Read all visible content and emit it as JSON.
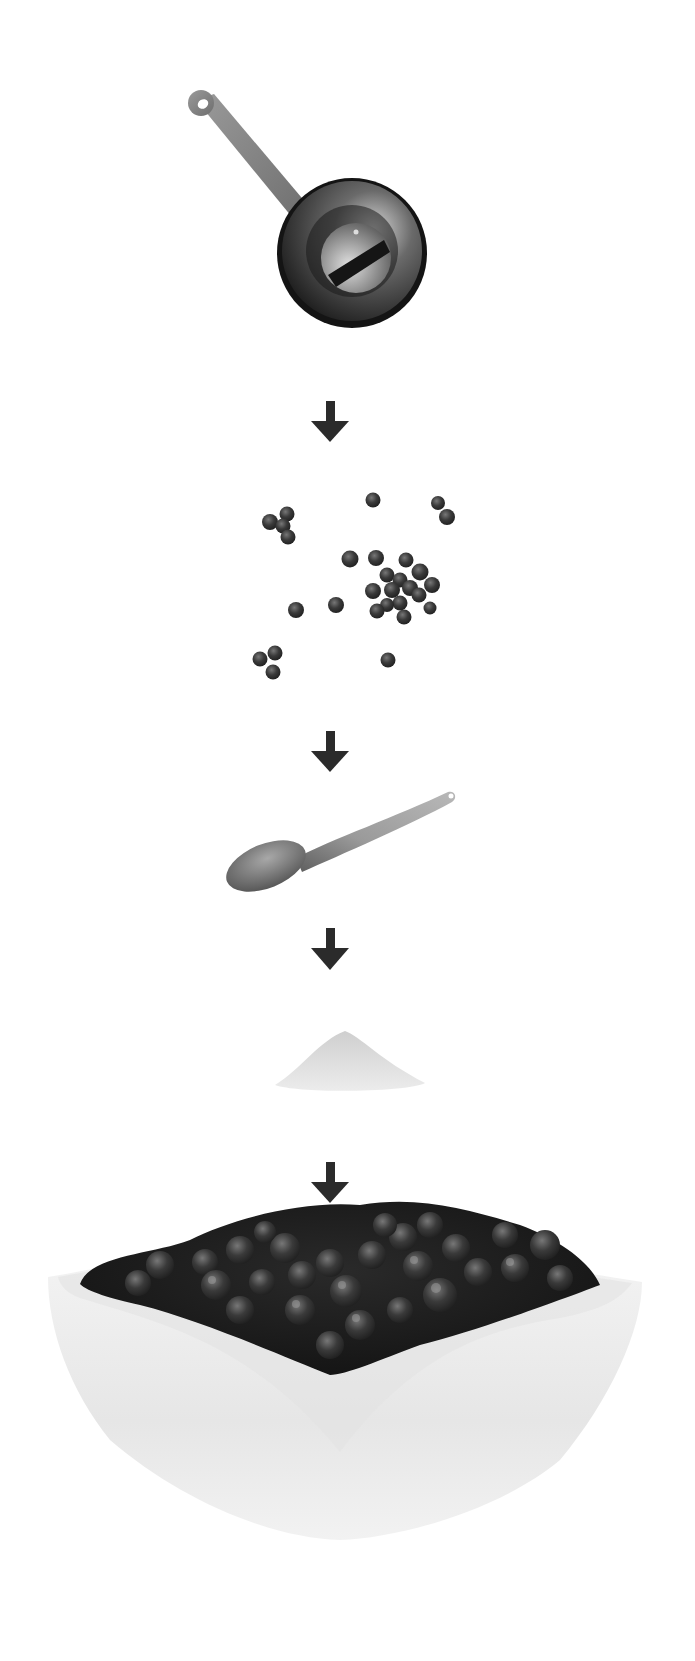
{
  "figure": {
    "type": "recipe-step-illustration",
    "steps": [
      {
        "id": "saucepan",
        "label": "Saucepan",
        "icon": "saucepan-icon"
      },
      {
        "id": "blueberries",
        "label": "Blueberries",
        "icon": "blueberries-icon"
      },
      {
        "id": "wooden-spoon",
        "label": "Spoon",
        "icon": "spoon-icon"
      },
      {
        "id": "sugar",
        "label": "Sugar",
        "icon": "sugar-pile-icon"
      },
      {
        "id": "blueberry-compote",
        "label": "Bowl of blueberry compote",
        "icon": "bowl-icon"
      }
    ],
    "connector": "arrow-down-icon",
    "colors": {
      "background": "#ffffff",
      "arrow": "#2b2b2b",
      "pan_dark": "#1c1c1c",
      "pan_handle": "#8a8a8a",
      "berry": "#3a3a3a",
      "spoon": "#8c8c8c",
      "sugar": "#dcdcdc",
      "bowl": "#efefef"
    }
  }
}
